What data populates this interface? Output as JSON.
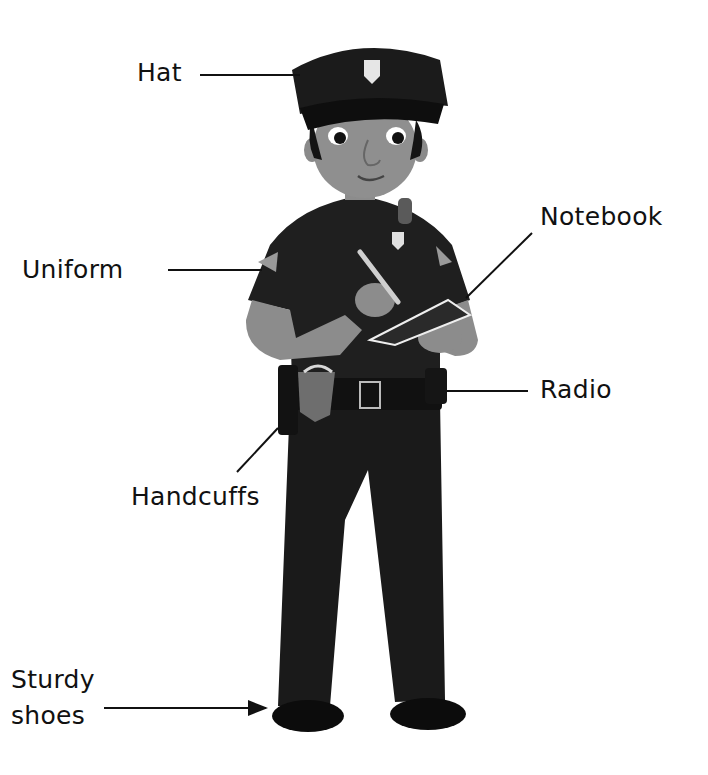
{
  "diagram": {
    "labels": [
      {
        "id": "hat",
        "text": "Hat"
      },
      {
        "id": "uniform",
        "text": "Uniform"
      },
      {
        "id": "notebook",
        "text": "Notebook"
      },
      {
        "id": "radio",
        "text": "Radio"
      },
      {
        "id": "handcuffs",
        "text": "Handcuffs"
      },
      {
        "id": "shoes",
        "line1": "Sturdy",
        "line2": "shoes"
      }
    ]
  },
  "colors": {
    "background": "#ffffff",
    "text": "#111111",
    "uniform": "#1c1c1c",
    "skin": "#8c8c8c"
  }
}
